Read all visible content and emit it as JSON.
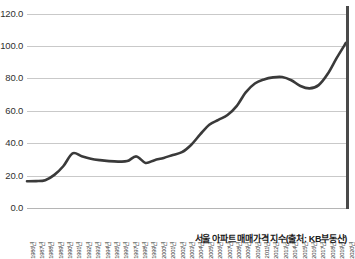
{
  "chart_data": {
    "type": "line",
    "title": "",
    "caption": "서울 아파트 매매가격 지수(출처: KB부동산)",
    "xlabel": "",
    "ylabel": "",
    "ylim": [
      0.0,
      120.0
    ],
    "y_ticks": [
      "0.0",
      "20.0",
      "40.0",
      "60.0",
      "80.0",
      "100.0",
      "120.0"
    ],
    "y_tick_values": [
      0.0,
      20.0,
      40.0,
      60.0,
      80.0,
      100.0,
      120.0
    ],
    "grid": "horizontal",
    "legend": "none",
    "line_color": "#3a3a3a",
    "grid_color": "#c9c9c9",
    "axis_color": "#4a4a4a",
    "categories": [
      "1986년",
      "1987년",
      "1988년",
      "1989년",
      "1990년",
      "1991년",
      "1992년",
      "1993년",
      "1994년",
      "1995년",
      "1996년",
      "1997년",
      "1998년",
      "1999년",
      "2000년",
      "2001년",
      "2002년",
      "2003년",
      "2004년",
      "2005년",
      "2006년",
      "2007년",
      "2008년",
      "2009년",
      "2010년",
      "2011년",
      "2012년",
      "2013년",
      "2014년",
      "2015년",
      "2016년",
      "2017년",
      "2018년",
      "2019년",
      "2020년"
    ],
    "series": [
      {
        "name": "서울 아파트 매매가격 지수",
        "values": [
          16.5,
          16.6,
          17.2,
          20.5,
          26.0,
          33.8,
          32.0,
          30.5,
          29.6,
          29.0,
          28.7,
          29.0,
          31.9,
          27.9,
          29.6,
          31.0,
          32.8,
          34.5,
          39.0,
          45.5,
          51.5,
          54.5,
          57.5,
          63.0,
          71.5,
          77.0,
          79.5,
          80.8,
          81.0,
          79.0,
          75.5,
          74.0,
          76.0,
          83.0,
          93.0
        ]
      }
    ],
    "note_last_value": 102.2
  }
}
